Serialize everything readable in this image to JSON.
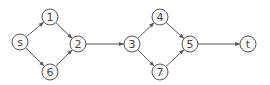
{
  "diagram": {
    "type": "directed-graph",
    "node_radius": 8,
    "stroke_color": "#555555",
    "nodes": [
      {
        "id": "s",
        "label": "s",
        "x": 20,
        "y": 42
      },
      {
        "id": "1",
        "label": "1",
        "x": 50,
        "y": 17
      },
      {
        "id": "6",
        "label": "6",
        "x": 50,
        "y": 72
      },
      {
        "id": "2",
        "label": "2",
        "x": 78,
        "y": 44
      },
      {
        "id": "3",
        "label": "3",
        "x": 132,
        "y": 44
      },
      {
        "id": "4",
        "label": "4",
        "x": 160,
        "y": 17
      },
      {
        "id": "7",
        "label": "7",
        "x": 160,
        "y": 72
      },
      {
        "id": "5",
        "label": "5",
        "x": 190,
        "y": 44
      },
      {
        "id": "t",
        "label": "t",
        "x": 248,
        "y": 44
      }
    ],
    "edges": [
      {
        "from": "s",
        "to": "1"
      },
      {
        "from": "s",
        "to": "6"
      },
      {
        "from": "1",
        "to": "2"
      },
      {
        "from": "6",
        "to": "2"
      },
      {
        "from": "2",
        "to": "3"
      },
      {
        "from": "3",
        "to": "4"
      },
      {
        "from": "3",
        "to": "7"
      },
      {
        "from": "4",
        "to": "5"
      },
      {
        "from": "7",
        "to": "5"
      },
      {
        "from": "5",
        "to": "t"
      }
    ]
  }
}
